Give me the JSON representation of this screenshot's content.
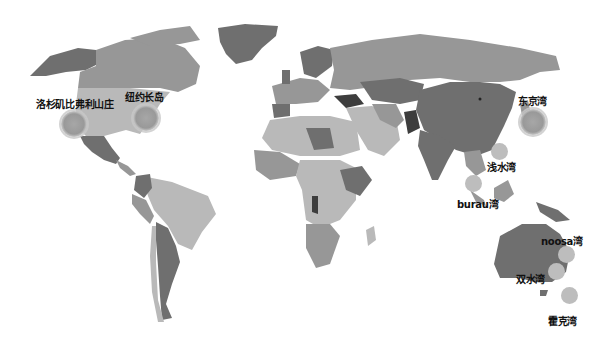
{
  "map": {
    "type": "world-choropleth",
    "palette": {
      "land_light": "#b9b9b9",
      "land_mid": "#979797",
      "land_dark": "#6f6f6f",
      "land_darkest": "#3d3d3d",
      "ocean": "#ffffff"
    },
    "markers": [
      {
        "id": "la",
        "label": "洛杉矶比弗利山庄",
        "x": 74,
        "y": 124,
        "size": "big",
        "label_x": 36,
        "label_y": 96
      },
      {
        "id": "ny",
        "label": "纽约长岛",
        "x": 146,
        "y": 118,
        "size": "big",
        "label_x": 125,
        "label_y": 89
      },
      {
        "id": "tokyo",
        "label": "东京湾",
        "x": 533,
        "y": 122,
        "size": "big",
        "label_x": 518,
        "label_y": 93
      },
      {
        "id": "repulse",
        "label": "浅水湾",
        "x": 500,
        "y": 152,
        "size": "small",
        "label_x": 487,
        "label_y": 159
      },
      {
        "id": "burau",
        "label": "burau湾",
        "x": 474,
        "y": 184,
        "size": "small",
        "label_x": 457,
        "label_y": 196
      },
      {
        "id": "noosa",
        "label": "noosa湾",
        "x": 567,
        "y": 255,
        "size": "small",
        "label_x": 541,
        "label_y": 233
      },
      {
        "id": "twinwaters",
        "label": "双水湾",
        "x": 557,
        "y": 272,
        "size": "small",
        "label_x": 516,
        "label_y": 271
      },
      {
        "id": "hawke",
        "label": "霍克湾",
        "x": 570,
        "y": 296,
        "size": "small",
        "label_x": 548,
        "label_y": 313
      }
    ]
  }
}
